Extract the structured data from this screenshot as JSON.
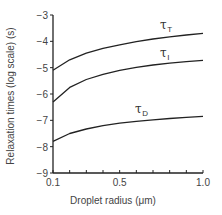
{
  "chart_data": {
    "type": "line",
    "title": "",
    "xlabel": "Droplet radius (μm)",
    "ylabel": "Relaxation times (log scale) (s)",
    "xlim": [
      0.1,
      1.0
    ],
    "ylim": [
      -9,
      -3
    ],
    "x_ticks": [
      0.1,
      0.2,
      0.3,
      0.4,
      0.5,
      0.6,
      0.7,
      0.8,
      0.9,
      1.0
    ],
    "x_tick_labels": [
      "0.1",
      "0.5",
      "1.0"
    ],
    "y_ticks": [
      -3,
      -4,
      -5,
      -6,
      -7,
      -8,
      -9
    ],
    "y_tick_labels": [
      "−3",
      "−4",
      "−5",
      "−6",
      "−7",
      "−8",
      "−9"
    ],
    "grid": false,
    "legend": "inline labels",
    "x": [
      0.1,
      0.2,
      0.3,
      0.4,
      0.5,
      0.6,
      0.7,
      0.8,
      0.9,
      1.0
    ],
    "series": [
      {
        "name": "τT",
        "symbol": "τ",
        "subscript": "T",
        "values": [
          -5.1,
          -4.7,
          -4.45,
          -4.27,
          -4.13,
          -4.01,
          -3.91,
          -3.83,
          -3.76,
          -3.7
        ]
      },
      {
        "name": "τI",
        "symbol": "τ",
        "subscript": "I",
        "values": [
          -6.3,
          -5.75,
          -5.45,
          -5.25,
          -5.1,
          -4.99,
          -4.9,
          -4.83,
          -4.77,
          -4.72
        ]
      },
      {
        "name": "τD",
        "symbol": "τ",
        "subscript": "D",
        "values": [
          -7.8,
          -7.5,
          -7.33,
          -7.2,
          -7.11,
          -7.04,
          -6.98,
          -6.93,
          -6.89,
          -6.85
        ]
      }
    ]
  }
}
